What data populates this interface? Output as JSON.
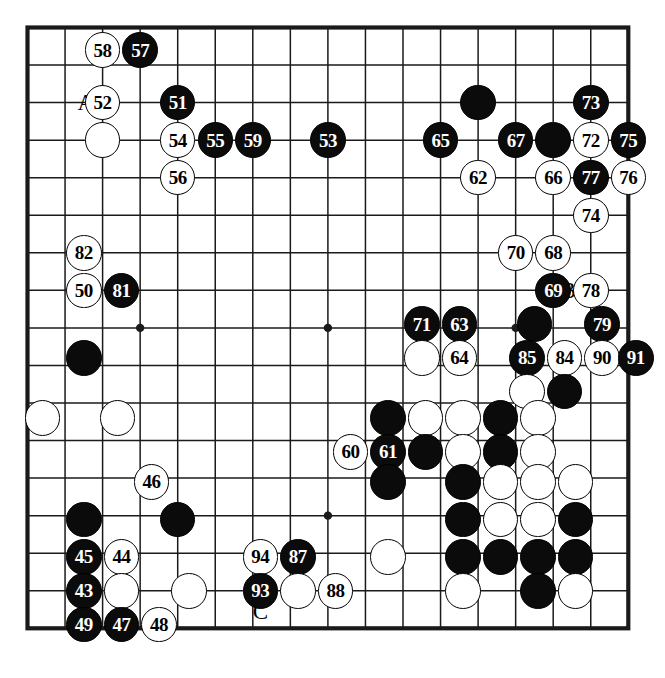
{
  "diagram": {
    "type": "go-board-move-diagram",
    "board_size": 17,
    "colors": {
      "black_stone": "#0b0b0b",
      "white_stone": "#ffffff",
      "line": "#1a1a1a",
      "background": "#ffffff"
    },
    "star_points": [
      {
        "col": 3,
        "row": 8
      },
      {
        "col": 8,
        "row": 8
      },
      {
        "col": 8,
        "row": 13
      },
      {
        "col": 13,
        "row": 8
      }
    ],
    "markers": [
      {
        "label": "A",
        "col": 1.55,
        "row": 2
      },
      {
        "label": "B",
        "col": 14.4,
        "row": 7
      },
      {
        "label": "C",
        "col": 6.2,
        "row": 15.55
      }
    ],
    "stones": [
      {
        "n": "58",
        "color": "white",
        "col": 2,
        "row": 0.6
      },
      {
        "n": "57",
        "color": "black",
        "col": 3,
        "row": 0.6
      },
      {
        "n": "52",
        "color": "white",
        "col": 2,
        "row": 2
      },
      {
        "n": "51",
        "color": "black",
        "col": 4,
        "row": 2
      },
      {
        "n": "",
        "color": "black",
        "col": 12,
        "row": 2
      },
      {
        "n": "73",
        "color": "black",
        "col": 15,
        "row": 2
      },
      {
        "n": "",
        "color": "white",
        "col": 2,
        "row": 3
      },
      {
        "n": "54",
        "color": "white",
        "col": 4,
        "row": 3
      },
      {
        "n": "55",
        "color": "black",
        "col": 5,
        "row": 3
      },
      {
        "n": "59",
        "color": "black",
        "col": 6,
        "row": 3
      },
      {
        "n": "53",
        "color": "black",
        "col": 8,
        "row": 3
      },
      {
        "n": "65",
        "color": "black",
        "col": 11,
        "row": 3
      },
      {
        "n": "67",
        "color": "black",
        "col": 13,
        "row": 3
      },
      {
        "n": "",
        "color": "black",
        "col": 14,
        "row": 3
      },
      {
        "n": "72",
        "color": "white",
        "col": 15,
        "row": 3
      },
      {
        "n": "75",
        "color": "black",
        "col": 16,
        "row": 3
      },
      {
        "n": "56",
        "color": "white",
        "col": 4,
        "row": 4
      },
      {
        "n": "62",
        "color": "white",
        "col": 12,
        "row": 4
      },
      {
        "n": "66",
        "color": "white",
        "col": 14,
        "row": 4
      },
      {
        "n": "77",
        "color": "black",
        "col": 15,
        "row": 4
      },
      {
        "n": "76",
        "color": "white",
        "col": 16,
        "row": 4
      },
      {
        "n": "74",
        "color": "white",
        "col": 15,
        "row": 5
      },
      {
        "n": "82",
        "color": "white",
        "col": 1.5,
        "row": 6
      },
      {
        "n": "70",
        "color": "white",
        "col": 13,
        "row": 6
      },
      {
        "n": "68",
        "color": "white",
        "col": 14,
        "row": 6
      },
      {
        "n": "50",
        "color": "white",
        "col": 1.5,
        "row": 7
      },
      {
        "n": "81",
        "color": "black",
        "col": 2.5,
        "row": 7
      },
      {
        "n": "69",
        "color": "black",
        "col": 14,
        "row": 7
      },
      {
        "n": "78",
        "color": "white",
        "col": 15,
        "row": 7
      },
      {
        "n": "71",
        "color": "black",
        "col": 10.5,
        "row": 7.9
      },
      {
        "n": "63",
        "color": "black",
        "col": 11.5,
        "row": 7.9
      },
      {
        "n": "",
        "color": "black",
        "col": 13.5,
        "row": 7.9
      },
      {
        "n": "79",
        "color": "black",
        "col": 15.3,
        "row": 7.9
      },
      {
        "n": "",
        "color": "black",
        "col": 1.5,
        "row": 8.8
      },
      {
        "n": "",
        "color": "white",
        "col": 10.5,
        "row": 8.8
      },
      {
        "n": "64",
        "color": "white",
        "col": 11.5,
        "row": 8.8
      },
      {
        "n": "85",
        "color": "black",
        "col": 13.3,
        "row": 8.8
      },
      {
        "n": "84",
        "color": "white",
        "col": 14.3,
        "row": 8.8
      },
      {
        "n": "90",
        "color": "white",
        "col": 15.3,
        "row": 8.8
      },
      {
        "n": "91",
        "color": "black",
        "col": 16.2,
        "row": 8.8
      },
      {
        "n": "",
        "color": "white",
        "col": 13.3,
        "row": 9.7
      },
      {
        "n": "",
        "color": "black",
        "col": 14.3,
        "row": 9.7
      },
      {
        "n": "",
        "color": "white",
        "col": 0.4,
        "row": 10.4
      },
      {
        "n": "",
        "color": "white",
        "col": 2.4,
        "row": 10.4
      },
      {
        "n": "",
        "color": "black",
        "col": 9.6,
        "row": 10.4
      },
      {
        "n": "",
        "color": "white",
        "col": 10.6,
        "row": 10.4
      },
      {
        "n": "",
        "color": "white",
        "col": 11.6,
        "row": 10.4
      },
      {
        "n": "",
        "color": "black",
        "col": 12.6,
        "row": 10.4
      },
      {
        "n": "",
        "color": "white",
        "col": 13.6,
        "row": 10.4
      },
      {
        "n": "60",
        "color": "white",
        "col": 8.6,
        "row": 11.3
      },
      {
        "n": "61",
        "color": "black",
        "col": 9.6,
        "row": 11.3
      },
      {
        "n": "",
        "color": "black",
        "col": 10.6,
        "row": 11.3
      },
      {
        "n": "",
        "color": "white",
        "col": 11.6,
        "row": 11.3
      },
      {
        "n": "",
        "color": "black",
        "col": 12.6,
        "row": 11.3
      },
      {
        "n": "",
        "color": "white",
        "col": 13.6,
        "row": 11.3
      },
      {
        "n": "46",
        "color": "white",
        "col": 3.3,
        "row": 12.1
      },
      {
        "n": "",
        "color": "black",
        "col": 9.6,
        "row": 12.1
      },
      {
        "n": "",
        "color": "black",
        "col": 11.6,
        "row": 12.1
      },
      {
        "n": "",
        "color": "white",
        "col": 12.6,
        "row": 12.1
      },
      {
        "n": "",
        "color": "white",
        "col": 13.6,
        "row": 12.1
      },
      {
        "n": "",
        "color": "white",
        "col": 14.6,
        "row": 12.1
      },
      {
        "n": "",
        "color": "black",
        "col": 1.5,
        "row": 13.1
      },
      {
        "n": "",
        "color": "black",
        "col": 4,
        "row": 13.1
      },
      {
        "n": "",
        "color": "black",
        "col": 11.6,
        "row": 13.1
      },
      {
        "n": "",
        "color": "white",
        "col": 12.6,
        "row": 13.1
      },
      {
        "n": "",
        "color": "white",
        "col": 13.6,
        "row": 13.1
      },
      {
        "n": "",
        "color": "black",
        "col": 14.6,
        "row": 13.1
      },
      {
        "n": "45",
        "color": "black",
        "col": 1.5,
        "row": 14.1
      },
      {
        "n": "44",
        "color": "white",
        "col": 2.5,
        "row": 14.1
      },
      {
        "n": "94",
        "color": "white",
        "col": 6.2,
        "row": 14.1
      },
      {
        "n": "87",
        "color": "black",
        "col": 7.2,
        "row": 14.1
      },
      {
        "n": "",
        "color": "white",
        "col": 9.6,
        "row": 14.1
      },
      {
        "n": "",
        "color": "black",
        "col": 11.6,
        "row": 14.1
      },
      {
        "n": "",
        "color": "black",
        "col": 12.6,
        "row": 14.1
      },
      {
        "n": "",
        "color": "black",
        "col": 13.6,
        "row": 14.1
      },
      {
        "n": "",
        "color": "black",
        "col": 14.6,
        "row": 14.1
      },
      {
        "n": "43",
        "color": "black",
        "col": 1.5,
        "row": 15
      },
      {
        "n": "",
        "color": "white",
        "col": 2.5,
        "row": 15
      },
      {
        "n": "",
        "color": "white",
        "col": 4.3,
        "row": 15
      },
      {
        "n": "93",
        "color": "black",
        "col": 6.2,
        "row": 15
      },
      {
        "n": "",
        "color": "white",
        "col": 7.2,
        "row": 15
      },
      {
        "n": "88",
        "color": "white",
        "col": 8.2,
        "row": 15
      },
      {
        "n": "",
        "color": "white",
        "col": 11.6,
        "row": 15
      },
      {
        "n": "",
        "color": "black",
        "col": 13.6,
        "row": 15
      },
      {
        "n": "",
        "color": "white",
        "col": 14.6,
        "row": 15
      },
      {
        "n": "49",
        "color": "black",
        "col": 1.5,
        "row": 15.9
      },
      {
        "n": "47",
        "color": "black",
        "col": 2.5,
        "row": 15.9
      },
      {
        "n": "48",
        "color": "white",
        "col": 3.5,
        "row": 15.9
      }
    ]
  }
}
